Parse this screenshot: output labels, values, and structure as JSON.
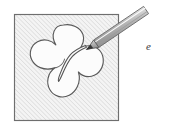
{
  "figure": {
    "caption_label": "e",
    "colors": {
      "frame_stroke": "#6e6e6e",
      "frame_fill": "#f2f2f2",
      "hatch_line": "#d2d2d2",
      "blob_stroke": "#5a5a5a",
      "blob_fill": "#fbfbfb",
      "pen_body_light": "#f0f0f0",
      "pen_body_mid": "#b9b9b9",
      "pen_body_dark": "#8d8d8d",
      "pen_outline": "#6b6b6b",
      "pen_tip": "#3a3a3a",
      "stroke_curve": "#555555",
      "label_text": "#3b3b3b",
      "page_background": "#ffffff"
    },
    "frame": {
      "name": "hatched-square",
      "x": 14,
      "y": 14,
      "width": 105,
      "height": 107,
      "hatch_angle_deg": 45,
      "hatch_spacing_px": 3
    },
    "blob": {
      "name": "five-lobed-cavity",
      "lobes": 5,
      "center_x": 64,
      "center_y": 66
    },
    "pen": {
      "name": "stylus",
      "tip_x": 87,
      "tip_y": 49,
      "tail_x": 145,
      "tail_y": 11
    },
    "drawn_curve": {
      "name": "traced-line",
      "start_x": 86,
      "start_y": 48,
      "end_x": 62,
      "end_y": 78
    },
    "label_position": {
      "x": 146,
      "y": 40
    }
  }
}
